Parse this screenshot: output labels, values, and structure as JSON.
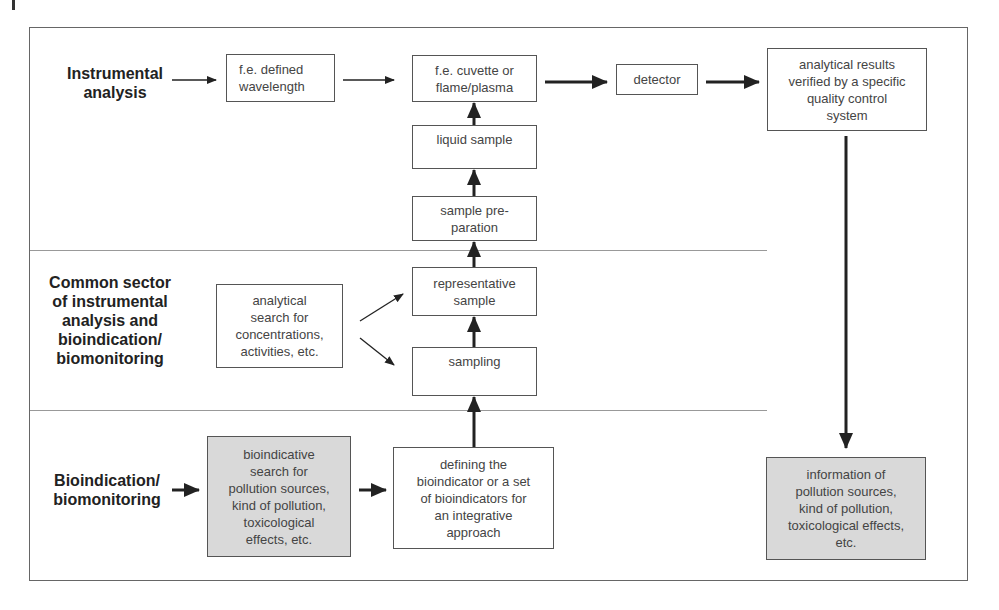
{
  "diagram": {
    "sections": [
      {
        "id": "instrumental",
        "label": "Instrumental\nanalysis"
      },
      {
        "id": "common",
        "label": "Common sector\nof instrumental\nanalysis and\nbioindication/\nbiomonitoring"
      },
      {
        "id": "bio",
        "label": "Bioindication/\nbiomonitoring"
      }
    ],
    "boxes": {
      "wavelength": "f.e. defined\nwavelength",
      "cuvette": "f.e. cuvette or\nflame/plasma",
      "detector": "detector",
      "results": "analytical results\nverified by a specific\nquality control\nsystem",
      "liquid_sample": "liquid sample",
      "sample_prep": "sample pre-\nparation",
      "representative": "representative\nsample",
      "sampling": "sampling",
      "analytical_search": "analytical\nsearch for\nconcentrations,\nactivities, etc.",
      "bioindicative_search": "bioindicative\nsearch for\npollution sources,\nkind of pollution,\ntoxicological\neffects, etc.",
      "defining": "defining the\nbioindicator or a set\nof bioindicators for\nan integrative\napproach",
      "information": "information of\npollution sources,\nkind of pollution,\ntoxicological effects,\netc."
    },
    "colors": {
      "shaded_box": "#d9d9d9",
      "line": "#555555",
      "arrow": "#222222"
    }
  }
}
